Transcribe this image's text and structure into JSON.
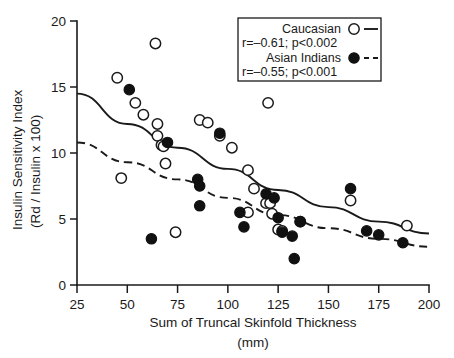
{
  "chart_data": {
    "type": "scatter",
    "title": "",
    "xlabel": "Sum of Truncal Skinfold Thickness",
    "xlabel_units": "(mm)",
    "ylabel_line1": "Insulin Sensitivity Index",
    "ylabel_line2": "(Rd / Insulin x 100)",
    "xlim": [
      25,
      200
    ],
    "ylim": [
      0,
      20
    ],
    "xticks": [
      25,
      50,
      75,
      100,
      125,
      150,
      175,
      200
    ],
    "yticks": [
      0,
      5,
      10,
      15,
      20
    ],
    "xticklabels": [
      "25",
      "50",
      "75",
      "100",
      "125",
      "150",
      "175",
      "200"
    ],
    "yticklabels": [
      "0",
      "5",
      "10",
      "15",
      "20"
    ],
    "grid": false,
    "legend_position": "top-right",
    "series": [
      {
        "name": "Caucasian",
        "marker": "open-circle",
        "linestyle": "solid",
        "stat": "r=–0.61; p<0.002",
        "correlation": -0.61,
        "pvalue": "<0.002",
        "points": [
          [
            45,
            15.7
          ],
          [
            47,
            8.1
          ],
          [
            54,
            13.8
          ],
          [
            58,
            12.9
          ],
          [
            64,
            18.3
          ],
          [
            65,
            12.2
          ],
          [
            65,
            11.3
          ],
          [
            67,
            10.6
          ],
          [
            68,
            10.5
          ],
          [
            69,
            9.2
          ],
          [
            74,
            4.0
          ],
          [
            86,
            12.5
          ],
          [
            90,
            12.3
          ],
          [
            96,
            11.3
          ],
          [
            102,
            10.4
          ],
          [
            110,
            8.7
          ],
          [
            113,
            7.3
          ],
          [
            119,
            6.2
          ],
          [
            120,
            13.8
          ],
          [
            121,
            6.2
          ],
          [
            110,
            5.5
          ],
          [
            122,
            5.4
          ],
          [
            125,
            4.2
          ],
          [
            127,
            4.1
          ],
          [
            136,
            4.8
          ],
          [
            161,
            6.4
          ],
          [
            189,
            4.5
          ]
        ]
      },
      {
        "name": "Asian Indians",
        "marker": "filled-circle",
        "linestyle": "dashed",
        "stat": "r=–0.55; p<0.001",
        "correlation": -0.55,
        "pvalue": "<0.001",
        "points": [
          [
            51,
            14.8
          ],
          [
            62,
            3.5
          ],
          [
            70,
            10.8
          ],
          [
            85,
            8.0
          ],
          [
            86,
            7.5
          ],
          [
            86,
            6.0
          ],
          [
            96,
            11.5
          ],
          [
            106,
            5.5
          ],
          [
            108,
            4.4
          ],
          [
            119,
            6.9
          ],
          [
            123,
            6.6
          ],
          [
            125,
            5.1
          ],
          [
            127,
            4.0
          ],
          [
            132,
            3.7
          ],
          [
            133,
            2.0
          ],
          [
            136,
            4.8
          ],
          [
            161,
            7.3
          ],
          [
            169,
            4.1
          ],
          [
            175,
            3.8
          ],
          [
            187,
            3.2
          ]
        ]
      }
    ],
    "fit_curves": [
      {
        "name": "Caucasian fit",
        "linestyle": "solid",
        "points": [
          [
            25,
            14.5
          ],
          [
            50,
            12.2
          ],
          [
            75,
            10.4
          ],
          [
            100,
            8.8
          ],
          [
            125,
            7.2
          ],
          [
            150,
            5.9
          ],
          [
            175,
            4.8
          ],
          [
            200,
            3.9
          ]
        ]
      },
      {
        "name": "Asian Indians fit",
        "linestyle": "dashed",
        "points": [
          [
            25,
            10.8
          ],
          [
            50,
            9.3
          ],
          [
            75,
            8.0
          ],
          [
            100,
            6.6
          ],
          [
            125,
            5.3
          ],
          [
            150,
            4.3
          ],
          [
            175,
            3.5
          ],
          [
            200,
            2.9
          ]
        ]
      }
    ]
  }
}
